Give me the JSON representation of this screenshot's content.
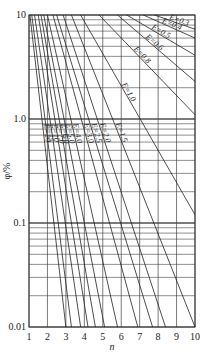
{
  "chart_data": {
    "type": "line",
    "title": "",
    "xlabel": "n",
    "ylabel": "φ/%",
    "xscale": "linear",
    "yscale": "log",
    "xlim": [
      1,
      10
    ],
    "ylim": [
      0.01,
      10
    ],
    "x_ticks": [
      "1",
      "2",
      "3",
      "4",
      "5",
      "6",
      "7",
      "8",
      "9",
      "10"
    ],
    "y_ticks": [
      "0.01",
      "0.1",
      "1.0",
      "10"
    ],
    "grid": true,
    "legend": "inline labels",
    "series": [
      {
        "name": "E=0.3",
        "points": [
          [
            7.8,
            10
          ],
          [
            10,
            7.3
          ]
        ]
      },
      {
        "name": "E=0.4",
        "points": [
          [
            7.2,
            10
          ],
          [
            10,
            6.0
          ]
        ]
      },
      {
        "name": "E=0.5",
        "points": [
          [
            6.3,
            10
          ],
          [
            10,
            4.1
          ]
        ]
      },
      {
        "name": "E=0.6",
        "points": [
          [
            5.8,
            10
          ],
          [
            10,
            2.3
          ]
        ]
      },
      {
        "name": "E=0.8",
        "points": [
          [
            4.8,
            10
          ],
          [
            10,
            1.1
          ]
        ]
      },
      {
        "name": "E=1.0",
        "points": [
          [
            3.8,
            10
          ],
          [
            10,
            0.12
          ]
        ]
      },
      {
        "name": "E=1.5",
        "points": [
          [
            3.3,
            10
          ],
          [
            10,
            0.01
          ]
        ]
      },
      {
        "name": "E=2.0",
        "points": [
          [
            2.85,
            10
          ],
          [
            8.4,
            0.01
          ]
        ]
      },
      {
        "name": "E=2.5",
        "points": [
          [
            2.5,
            10
          ],
          [
            7.7,
            0.01
          ]
        ]
      },
      {
        "name": "E=3.0",
        "points": [
          [
            2.3,
            10
          ],
          [
            6.9,
            0.01
          ]
        ]
      },
      {
        "name": "E=4.0",
        "points": [
          [
            2.0,
            10
          ],
          [
            5.8,
            0.01
          ]
        ]
      },
      {
        "name": "E=5.0",
        "points": [
          [
            1.8,
            10
          ],
          [
            5.1,
            0.01
          ]
        ]
      },
      {
        "name": "E=6.0",
        "points": [
          [
            1.65,
            10
          ],
          [
            4.6,
            0.01
          ]
        ]
      },
      {
        "name": "E=7.0",
        "points": [
          [
            1.5,
            10
          ],
          [
            4.2,
            0.01
          ]
        ]
      },
      {
        "name": "E=10",
        "points": [
          [
            1.3,
            10
          ],
          [
            3.8,
            0.01
          ]
        ]
      },
      {
        "name": "E=15",
        "points": [
          [
            1.15,
            10
          ],
          [
            3.3,
            0.01
          ]
        ]
      },
      {
        "name": "E=20",
        "points": [
          [
            1.05,
            10
          ],
          [
            3.0,
            0.01
          ]
        ]
      }
    ]
  },
  "labels": {
    "xlabel": "n",
    "ylabel": "φ/%"
  }
}
